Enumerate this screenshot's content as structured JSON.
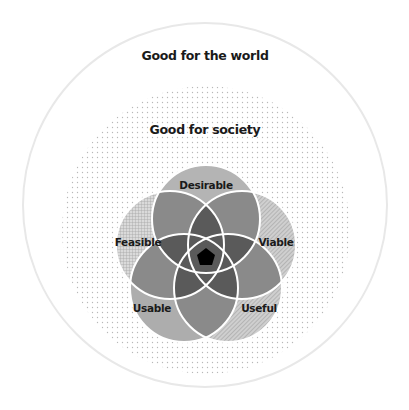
{
  "diagram": {
    "outer_circle": {
      "label": "Good for the world",
      "cx": 205,
      "cy": 205,
      "r": 182,
      "stroke": "#e8e8e8"
    },
    "inner_circle": {
      "label": "Good for society",
      "cx": 206,
      "cy": 230,
      "r": 144,
      "dot_color": "#b8b8b8"
    },
    "venn": {
      "center": {
        "x": 206,
        "y": 257
      },
      "radius": 54,
      "stroke": "#ffffff",
      "circles": [
        {
          "label": "Desirable",
          "cx": 206,
          "cy": 219,
          "fill": "#b4b4b4",
          "label_x": 206,
          "label_y": 186
        },
        {
          "label": "Viable",
          "cx": 242,
          "cy": 245,
          "fill": "#c8c8c8",
          "label_x": 276,
          "label_y": 243
        },
        {
          "label": "Useful",
          "cx": 228,
          "cy": 288,
          "fill": "#bdbdbd",
          "label_x": 259,
          "label_y": 309
        },
        {
          "label": "Usable",
          "cx": 184,
          "cy": 288,
          "fill": "#b0b0b0",
          "label_x": 152,
          "label_y": 309
        },
        {
          "label": "Feasible",
          "cx": 170,
          "cy": 245,
          "fill": "#d2d2d2",
          "label_x": 138,
          "label_y": 243
        }
      ],
      "center_pentagon_fill": "#000000"
    }
  }
}
